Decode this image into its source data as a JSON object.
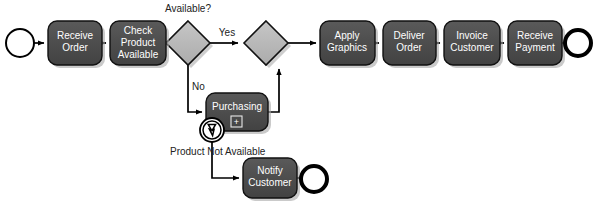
{
  "diagram": {
    "type": "bpmn-process-diagram",
    "title": "",
    "background_color": "#ffffff",
    "colors": {
      "task_fill": "#4a4a4a",
      "task_fill_top": "#565656",
      "task_stroke": "#111111",
      "task_text": "#ffffff",
      "gateway_fill": "#b8b8b8",
      "gateway_stroke": "#111111",
      "event_fill": "#ffffff",
      "event_stroke": "#000000",
      "flow_stroke": "#000000",
      "label_text": "#222222",
      "shadow": "#9a9a9a"
    }
  },
  "events": [
    {
      "id": "start-event",
      "name": "start-event",
      "kind": "start",
      "label": "",
      "cx": 20,
      "cy": 43,
      "r": 14,
      "stroke_width": 2
    },
    {
      "id": "end-event-main",
      "name": "end-event-payment-received",
      "kind": "end",
      "label": "",
      "cx": 578,
      "cy": 43,
      "r": 14,
      "stroke_width": 4
    },
    {
      "id": "end-event-notify",
      "name": "end-event-customer-notified",
      "kind": "end",
      "label": "",
      "cx": 314,
      "cy": 179,
      "r": 14,
      "stroke_width": 4
    },
    {
      "id": "boundary-error-event",
      "name": "error-boundary-event",
      "kind": "boundary-error",
      "label": "",
      "cx": 212,
      "cy": 130,
      "r": 12,
      "inner_r": 9,
      "stroke_width": 2,
      "symbol": "lightning-bolt"
    }
  ],
  "tasks": [
    {
      "id": "task-receive-order",
      "name": "task-receive-order",
      "lines": [
        "Receive",
        "Order"
      ],
      "x": 48,
      "y": 21,
      "w": 54,
      "h": 44,
      "marker": ""
    },
    {
      "id": "task-check-product-available",
      "name": "task-check-product-available",
      "lines": [
        "Check",
        "Product",
        "Available"
      ],
      "x": 110,
      "y": 21,
      "w": 56,
      "h": 44,
      "marker": ""
    },
    {
      "id": "task-apply-graphics",
      "name": "task-apply-graphics",
      "lines": [
        "Apply",
        "Graphics"
      ],
      "x": 320,
      "y": 21,
      "w": 55,
      "h": 44,
      "marker": ""
    },
    {
      "id": "task-deliver-order",
      "name": "task-deliver-order",
      "lines": [
        "Deliver",
        "Order"
      ],
      "x": 383,
      "y": 21,
      "w": 53,
      "h": 44,
      "marker": ""
    },
    {
      "id": "task-invoice-customer",
      "name": "task-invoice-customer",
      "lines": [
        "Invoice",
        "Customer"
      ],
      "x": 444,
      "y": 21,
      "w": 56,
      "h": 44,
      "marker": ""
    },
    {
      "id": "task-receive-payment",
      "name": "task-receive-payment",
      "lines": [
        "Receive",
        "Payment"
      ],
      "x": 508,
      "y": 21,
      "w": 54,
      "h": 44,
      "marker": ""
    },
    {
      "id": "task-purchasing",
      "name": "subprocess-purchasing",
      "lines": [
        "Purchasing"
      ],
      "x": 206,
      "y": 93,
      "w": 62,
      "h": 38,
      "marker": "+"
    },
    {
      "id": "task-notify-customer",
      "name": "task-notify-customer",
      "lines": [
        "Notify",
        "Customer"
      ],
      "x": 243,
      "y": 158,
      "w": 54,
      "h": 40,
      "marker": ""
    }
  ],
  "gateways": [
    {
      "id": "gateway-available",
      "name": "gateway-product-available-decision",
      "label": "Available?",
      "cx": 188,
      "cy": 43,
      "half": 22,
      "label_x": 188,
      "label_y": 11
    },
    {
      "id": "gateway-merge",
      "name": "gateway-merge",
      "label": "",
      "cx": 266,
      "cy": 43,
      "half": 22,
      "label_x": 0,
      "label_y": 0
    }
  ],
  "flow_labels": [
    {
      "id": "label-yes",
      "name": "flow-label-yes",
      "text": "Yes",
      "x": 227,
      "y": 35,
      "anchor": "middle"
    },
    {
      "id": "label-no",
      "name": "flow-label-no",
      "text": "No",
      "x": 192,
      "y": 89,
      "anchor": "start"
    },
    {
      "id": "label-product-not-available",
      "name": "flow-label-product-not-available",
      "text": "Product Not Available",
      "x": 171,
      "y": 154,
      "anchor": "start"
    }
  ],
  "flows": [
    {
      "id": "flow-start-to-receive",
      "name": "sequence-flow-start-to-receive-order"
    },
    {
      "id": "flow-receive-to-check",
      "name": "sequence-flow-receive-order-to-check-product"
    },
    {
      "id": "flow-check-to-gateway",
      "name": "sequence-flow-check-product-to-gateway"
    },
    {
      "id": "flow-gateway-yes",
      "name": "sequence-flow-yes-to-merge"
    },
    {
      "id": "flow-gateway-no",
      "name": "sequence-flow-no-to-purchasing"
    },
    {
      "id": "flow-purchasing-to-merge",
      "name": "sequence-flow-purchasing-to-merge"
    },
    {
      "id": "flow-merge-to-apply",
      "name": "sequence-flow-merge-to-apply-graphics"
    },
    {
      "id": "flow-apply-to-deliver",
      "name": "sequence-flow-apply-graphics-to-deliver-order"
    },
    {
      "id": "flow-deliver-to-invoice",
      "name": "sequence-flow-deliver-order-to-invoice-customer"
    },
    {
      "id": "flow-invoice-to-receive-payment",
      "name": "sequence-flow-invoice-customer-to-receive-payment"
    },
    {
      "id": "flow-receive-payment-to-end",
      "name": "sequence-flow-receive-payment-to-end"
    },
    {
      "id": "flow-error-to-notify",
      "name": "sequence-flow-error-to-notify-customer"
    },
    {
      "id": "flow-notify-to-end",
      "name": "sequence-flow-notify-customer-to-end"
    }
  ]
}
